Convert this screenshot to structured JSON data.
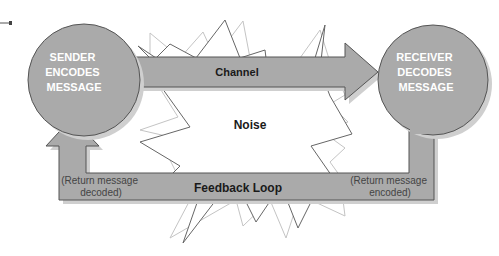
{
  "diagram": {
    "sender": {
      "lines": [
        "SENDER",
        "ENCODES",
        "MESSAGE"
      ]
    },
    "receiver": {
      "lines": [
        "RECEIVER",
        "DECODES",
        "MESSAGE"
      ]
    },
    "channel": {
      "label": "Channel"
    },
    "noise": {
      "label": "Noise"
    },
    "feedback": {
      "label": "Feedback Loop",
      "left_note": [
        "(Return message",
        "decoded)"
      ],
      "right_note": [
        "(Return message",
        "encoded)"
      ]
    },
    "colors": {
      "shape_fill": "#aaaaaa",
      "shape_stroke": "#555555",
      "shadow": "#cfcfcf",
      "circle_text": "#ffffff",
      "label_text": "#1a1a1a",
      "note_text": "#444444",
      "noise_dark": "#666666",
      "noise_light": "#c4c4c4"
    }
  }
}
